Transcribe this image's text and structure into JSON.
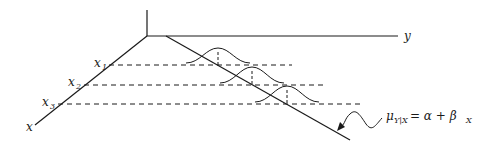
{
  "diagram": {
    "axes": {
      "x_label": "x",
      "y_label": "y"
    },
    "x_ticks": [
      {
        "label": "x",
        "sub": "1"
      },
      {
        "label": "x",
        "sub": "2"
      },
      {
        "label": "x",
        "sub": "3"
      }
    ],
    "annotation": {
      "mu": "μ",
      "mu_sub": "Y|X",
      "rhs": "= α + β",
      "rhs_sub": "X"
    },
    "colors": {
      "line": "#1a1a1a",
      "background": "#ffffff"
    }
  }
}
